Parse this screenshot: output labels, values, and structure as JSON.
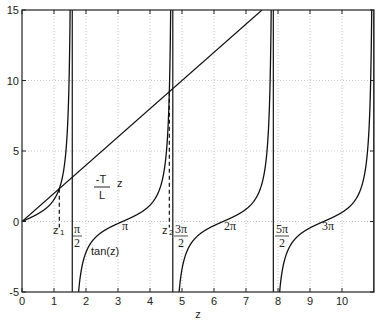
{
  "chart_data": {
    "type": "line",
    "title": "",
    "xlabel": "z",
    "ylabel": "",
    "xlim": [
      0,
      11
    ],
    "ylim": [
      -5,
      15
    ],
    "grid": true,
    "xticks": [
      "0",
      "1",
      "2",
      "3",
      "4",
      "5",
      "6",
      "7",
      "8",
      "9",
      "10"
    ],
    "yticks": [
      "-5",
      "0",
      "5",
      "10",
      "15"
    ],
    "series": [
      {
        "name": "tan(z)",
        "expression": "tan(z)",
        "asymptotes": [
          1.5708,
          4.7124,
          7.854,
          10.9956
        ]
      },
      {
        "name": "-T/L z",
        "expression": "2*z",
        "points": [
          [
            0,
            0
          ],
          [
            7.5,
            15
          ]
        ]
      }
    ],
    "intersections": [
      {
        "label": "z1",
        "x": 1.166,
        "y": 2.33
      },
      {
        "label": "z2",
        "x": 4.604,
        "y": 9.21
      }
    ],
    "annotations": {
      "line_label_num": "-T",
      "line_label_den": "L",
      "line_label_var": "z",
      "curve_label": "tan(z)",
      "z1": "z",
      "z1_sub": "1",
      "z2": "z",
      "z2_sub": "2",
      "pi_half_num": "π",
      "pi_half_den": "2",
      "three_pi_half_num": "3π",
      "three_pi_half_den": "2",
      "five_pi_half_num": "5π",
      "five_pi_half_den": "2",
      "pi": "π",
      "two_pi": "2π",
      "three_pi": "3π"
    }
  }
}
